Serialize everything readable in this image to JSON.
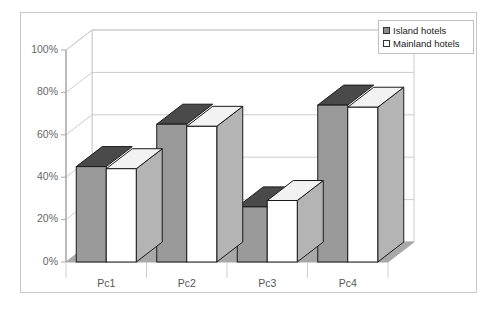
{
  "chart_data": {
    "type": "bar",
    "title": "",
    "subtitle": "",
    "xlabel": "",
    "ylabel": "",
    "categories": [
      "Pc1",
      "Pc2",
      "Pc3",
      "Pc4"
    ],
    "series": [
      {
        "name": "Island hotels",
        "values": [
          45,
          65,
          26,
          74
        ],
        "color": "#9a9a9a"
      },
      {
        "name": "Mainland hotels",
        "values": [
          44,
          64,
          29,
          73
        ],
        "color": "#ffffff"
      }
    ],
    "ylim": [
      0,
      100
    ],
    "yticks": [
      0,
      20,
      40,
      60,
      80,
      100
    ],
    "ytick_labels": [
      "0%",
      "20%",
      "40%",
      "60%",
      "80%",
      "100%"
    ],
    "grid": true,
    "grid_axis": "y",
    "legend_position": "top-right",
    "three_d": true
  },
  "legend": {
    "items": [
      {
        "label": "Island hotels",
        "swatch": "#9a9a9a"
      },
      {
        "label": "Mainland hotels",
        "swatch": "#ffffff"
      }
    ]
  },
  "axes": {
    "y_tick_labels": [
      "100%",
      "80%",
      "60%",
      "40%",
      "20%",
      "0%"
    ],
    "x_tick_labels": [
      "Pc1",
      "Pc2",
      "Pc3",
      "Pc4"
    ]
  },
  "colors": {
    "frame_border": "#c8c8c8",
    "plot_background": "#ffffff",
    "gridline": "#cccccc",
    "floor": "#a8a8a8",
    "axis_line": "#aaaaaa",
    "bar_island_front": "#9a9a9a",
    "bar_island_top": "#4a4a4a",
    "bar_island_side": "#8a8a8a",
    "bar_mainland_front": "#ffffff",
    "bar_mainland_top": "#f2f2f2",
    "bar_mainland_side": "#b4b4b4",
    "bar_outline": "#1a1a1a",
    "tick_text": "#666666"
  }
}
